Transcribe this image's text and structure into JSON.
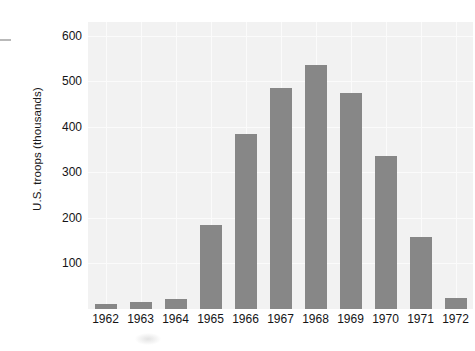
{
  "chart_data": {
    "type": "bar",
    "title": "",
    "subtitle": "",
    "xlabel": "",
    "ylabel": "U.S. troops (thousands)",
    "categories": [
      "1962",
      "1963",
      "1964",
      "1965",
      "1966",
      "1967",
      "1968",
      "1969",
      "1970",
      "1971",
      "1972"
    ],
    "values": [
      11,
      16,
      23,
      184,
      385,
      486,
      536,
      475,
      335,
      157,
      24
    ],
    "ylim": [
      0,
      630
    ],
    "yticks": [
      100,
      200,
      300,
      400,
      500,
      600
    ],
    "ytick_labels": [
      "100",
      "200",
      "300",
      "400",
      "500",
      "600"
    ],
    "grid": true,
    "grid_axis": "both",
    "legend": "none",
    "bar_color": "#878787",
    "plot_background": "#f2f2f2",
    "gridline_color": "#fbfbfb",
    "figure_background": "#ffffff",
    "text_color": "#141416",
    "annotations": []
  }
}
